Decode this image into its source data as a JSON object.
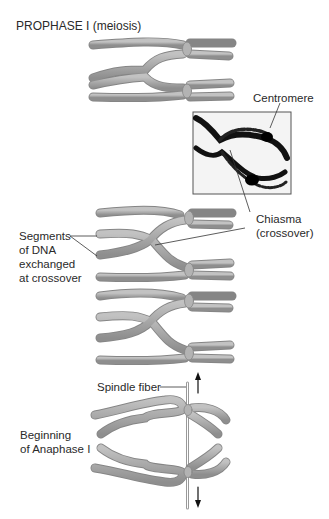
{
  "diagram": {
    "title": "PROPHASE I (meiosis)",
    "labels": {
      "centromere": "Centromere",
      "chiasma_line1": "Chiasma",
      "chiasma_line2": "(crossover)",
      "segments_line1": "Segments",
      "segments_line2": "of DNA",
      "segments_line3": "exchanged",
      "segments_line4": "at crossover",
      "spindle_fiber": "Spindle fiber",
      "anaphase_line1": "Beginning",
      "anaphase_line2": "of Anaphase I"
    },
    "stages": [
      {
        "name": "prophase-tetrad",
        "description": "Homologous chromosomes paired with crossover"
      },
      {
        "name": "micrograph",
        "description": "Photograph showing chiasma and centromeres"
      },
      {
        "name": "crossover-exchange-1",
        "description": "Chromatids crossing at chiasma"
      },
      {
        "name": "crossover-exchange-2",
        "description": "Chromatids crossing at chiasma"
      },
      {
        "name": "anaphase-I",
        "description": "Homologs pulled apart by spindle fibers"
      }
    ],
    "colors": {
      "chromosome_fill": "#a9a9a9",
      "chromosome_stroke": "#858585",
      "label_text": "#2a2a2a",
      "leader_line": "#333333"
    }
  }
}
